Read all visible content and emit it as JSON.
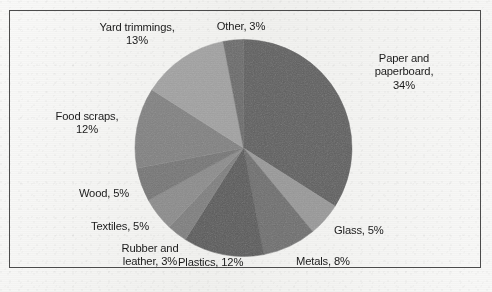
{
  "figure": {
    "background_color": "#f2f2f0",
    "frame_border_color": "#4c4c4c",
    "label_text_color": "#1b1b1b"
  },
  "chart_data": {
    "type": "pie",
    "title": "",
    "subtitle": "",
    "xlabel": "",
    "ylabel": "",
    "legend_position": "none",
    "labels_position": "outside-callout-text",
    "grid": false,
    "start_angle_deg": 0,
    "direction": "clockwise",
    "total_percent": 100,
    "categories": [
      "Paper and paperboard",
      "Glass",
      "Metals",
      "Plastics",
      "Rubber and leather",
      "Textiles",
      "Wood",
      "Food scraps",
      "Yard trimmings",
      "Other"
    ],
    "values": [
      34,
      5,
      8,
      12,
      3,
      5,
      5,
      12,
      13,
      3
    ],
    "slices": [
      {
        "name": "Paper and paperboard",
        "value": 34,
        "label": "Paper and\npaperboard,\n34%",
        "color": "#5f5f5f"
      },
      {
        "name": "Glass",
        "value": 5,
        "label": "Glass, 5%",
        "color": "#9a9a9a"
      },
      {
        "name": "Metals",
        "value": 8,
        "label": "Metals, 8%",
        "color": "#6f6f6f"
      },
      {
        "name": "Plastics",
        "value": 12,
        "label": "Plastics, 12%",
        "color": "#5a5a5a"
      },
      {
        "name": "Rubber and leather",
        "value": 3,
        "label": "Rubber and\nleather, 3%",
        "color": "#7f7f7f"
      },
      {
        "name": "Textiles",
        "value": 5,
        "label": "Textiles, 5%",
        "color": "#8c8c8c"
      },
      {
        "name": "Wood",
        "value": 5,
        "label": "Wood, 5%",
        "color": "#767676"
      },
      {
        "name": "Food scraps",
        "value": 12,
        "label": "Food scraps,\n12%",
        "color": "#828282"
      },
      {
        "name": "Yard trimmings",
        "value": 13,
        "label": "Yard trimmings,\n13%",
        "color": "#a3a3a3"
      },
      {
        "name": "Other",
        "value": 3,
        "label": "Other, 3%",
        "color": "#6b6b6b"
      }
    ]
  },
  "labels": {
    "yard_trimmings": "Yard trimmings,\n13%",
    "other": "Other, 3%",
    "paper_and_paperboard": "Paper and\npaperboard,\n34%",
    "food_scraps": "Food scraps,\n12%",
    "wood": "Wood, 5%",
    "textiles": "Textiles, 5%",
    "rubber_and_leather": "Rubber and\nleather, 3%",
    "plastics": "Plastics, 12%",
    "metals": "Metals, 8%",
    "glass": "Glass, 5%"
  }
}
